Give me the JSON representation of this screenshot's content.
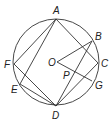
{
  "diagram": {
    "type": "geometry-circle-inscribed",
    "stroke_color": "#333333",
    "circle": {
      "cx": 56,
      "cy": 62,
      "r": 43
    },
    "points": [
      {
        "id": "A",
        "label": "A",
        "x": 56,
        "y": 19,
        "lx": 53,
        "ly": 14
      },
      {
        "id": "B",
        "label": "B",
        "x": 92,
        "y": 41,
        "lx": 95,
        "ly": 40
      },
      {
        "id": "C",
        "label": "C",
        "x": 98,
        "y": 63,
        "lx": 101,
        "ly": 67
      },
      {
        "id": "G",
        "label": "G",
        "x": 92,
        "y": 81,
        "lx": 95,
        "ly": 89
      },
      {
        "id": "D",
        "label": "D",
        "x": 56,
        "y": 106,
        "lx": 52,
        "ly": 119
      },
      {
        "id": "E",
        "label": "E",
        "x": 20,
        "y": 84,
        "lx": 11,
        "ly": 93
      },
      {
        "id": "F",
        "label": "F",
        "x": 14,
        "y": 64,
        "lx": 4,
        "ly": 68
      },
      {
        "id": "O",
        "label": "O",
        "x": 57,
        "y": 62,
        "lx": 48,
        "ly": 66
      },
      {
        "id": "P",
        "label": "P",
        "x": 64,
        "y": 68,
        "lx": 63,
        "ly": 79
      }
    ],
    "segments": [
      [
        "A",
        "C"
      ],
      [
        "A",
        "F"
      ],
      [
        "A",
        "E"
      ],
      [
        "F",
        "D"
      ],
      [
        "E",
        "D"
      ],
      [
        "D",
        "B"
      ],
      [
        "D",
        "C"
      ],
      [
        "B",
        "O"
      ],
      [
        "O",
        "G"
      ]
    ]
  }
}
